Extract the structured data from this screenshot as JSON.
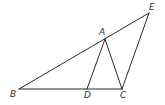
{
  "diagram": {
    "type": "geometry-figure",
    "points": {
      "A": {
        "label": "A",
        "x": 105,
        "y": 39,
        "lx": 99,
        "ly": 35
      },
      "B": {
        "label": "B",
        "x": 19,
        "y": 89,
        "lx": 10,
        "ly": 97
      },
      "C": {
        "label": "C",
        "x": 122,
        "y": 89,
        "lx": 120,
        "ly": 98
      },
      "D": {
        "label": "D",
        "x": 87,
        "y": 89,
        "lx": 84,
        "ly": 98
      },
      "E": {
        "label": "E",
        "x": 149,
        "y": 13,
        "lx": 149,
        "ly": 10
      }
    },
    "segments": [
      [
        "B",
        "E"
      ],
      [
        "B",
        "C"
      ],
      [
        "A",
        "D"
      ],
      [
        "A",
        "C"
      ],
      [
        "C",
        "E"
      ]
    ],
    "stroke_color": "#2a2a2a",
    "label_color": "#333333"
  }
}
